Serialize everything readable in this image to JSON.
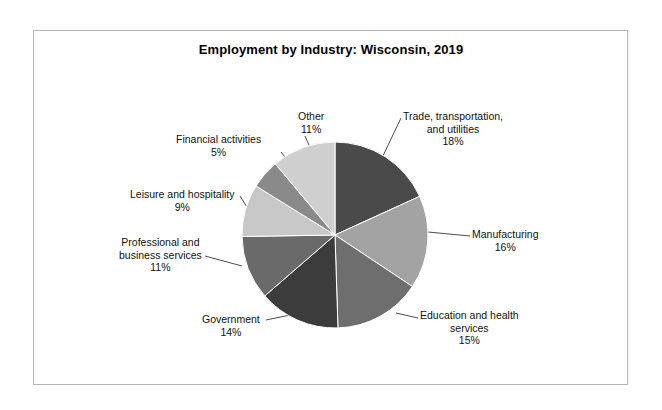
{
  "chart_data": {
    "type": "pie",
    "title": "Employment by Industry: Wisconsin, 2019",
    "xlabel": "",
    "ylabel": "",
    "legend_position": "none",
    "grid": false,
    "categories": [
      "Trade, transportation, and utilities",
      "Manufacturing",
      "Education and health services",
      "Government",
      "Professional and business services",
      "Leisure and hospitality",
      "Financial activities",
      "Other"
    ],
    "values": [
      18,
      16,
      15,
      14,
      11,
      9,
      5,
      11
    ],
    "unit": "%",
    "slices": [
      {
        "label": "Trade, transportation, and utilities",
        "label_line1": "Trade, transportation,",
        "label_line2": "and utilities",
        "value": 18,
        "pct": "18%",
        "color": "#4a4a4a"
      },
      {
        "label": "Manufacturing",
        "label_line1": "Manufacturing",
        "label_line2": "",
        "value": 16,
        "pct": "16%",
        "color": "#a3a3a3"
      },
      {
        "label": "Education and health services",
        "label_line1": "Education and health",
        "label_line2": "services",
        "value": 15,
        "pct": "15%",
        "color": "#6e6e6e"
      },
      {
        "label": "Government",
        "label_line1": "Government",
        "label_line2": "",
        "value": 14,
        "pct": "14%",
        "color": "#3c3c3c"
      },
      {
        "label": "Professional and business services",
        "label_line1": "Professional and",
        "label_line2": "business services",
        "value": 11,
        "pct": "11%",
        "color": "#6a6a6a"
      },
      {
        "label": "Leisure and hospitality",
        "label_line1": "Leisure and hospitality",
        "label_line2": "",
        "value": 9,
        "pct": "9%",
        "color": "#c8c8c8"
      },
      {
        "label": "Financial activities",
        "label_line1": "Financial activities",
        "label_line2": "",
        "value": 5,
        "pct": "5%",
        "color": "#8a8a8a"
      },
      {
        "label": "Other",
        "label_line1": "Other",
        "label_line2": "",
        "value": 11,
        "pct": "11%",
        "color": "#cfcfcf"
      }
    ]
  },
  "colors": {
    "background": "#ffffff",
    "frame_border": "#b4b4b4",
    "text": "#111111",
    "leader_line": "#4d4d4d"
  }
}
